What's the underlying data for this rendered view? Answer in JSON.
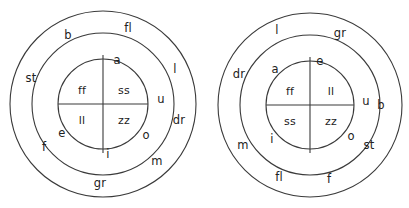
{
  "figure": {
    "type": "concentric-ring-diagram-pair",
    "background_color": "#ffffff",
    "stroke_color": "#3a3a3a",
    "text_color": "#222222"
  },
  "diagrams": [
    {
      "id": "left-diagram",
      "name": "left-syllable-ring-diagram",
      "center": {
        "x": 103,
        "y": 104
      },
      "circles": [
        {
          "name": "outer-ring-circle",
          "radius": 93
        },
        {
          "name": "middle-ring-circle",
          "radius": 71
        },
        {
          "name": "inner-core-circle",
          "radius": 45
        }
      ],
      "dividers": [
        {
          "name": "vertical-divider",
          "x1": 103,
          "y1": 55,
          "x2": 103,
          "y2": 153
        },
        {
          "name": "horizontal-divider",
          "x1": 58,
          "y1": 104,
          "x2": 148,
          "y2": 104
        }
      ],
      "inner_quadrants": [
        {
          "position": "top-left",
          "label": "ff",
          "x": 82,
          "y": 90
        },
        {
          "position": "top-right",
          "label": "ss",
          "x": 124,
          "y": 90
        },
        {
          "position": "bottom-left",
          "label": "ll",
          "x": 82,
          "y": 120
        },
        {
          "position": "bottom-right",
          "label": "zz",
          "x": 124,
          "y": 120
        }
      ],
      "middle_ring_labels": [
        {
          "label": "a",
          "x": 117,
          "y": 61
        },
        {
          "label": "u",
          "x": 161,
          "y": 100
        },
        {
          "label": "o",
          "x": 146,
          "y": 136
        },
        {
          "label": "i",
          "x": 108,
          "y": 155
        },
        {
          "label": "e",
          "x": 62,
          "y": 134
        }
      ],
      "outer_ring_labels": [
        {
          "label": "fl",
          "x": 128,
          "y": 29
        },
        {
          "label": "b",
          "x": 68,
          "y": 36
        },
        {
          "label": "st",
          "x": 31,
          "y": 79
        },
        {
          "label": "l",
          "x": 175,
          "y": 70
        },
        {
          "label": "dr",
          "x": 179,
          "y": 121
        },
        {
          "label": "m",
          "x": 157,
          "y": 162
        },
        {
          "label": "gr",
          "x": 100,
          "y": 184
        },
        {
          "label": "f",
          "x": 44,
          "y": 148
        }
      ]
    },
    {
      "id": "right-diagram",
      "name": "right-syllable-ring-diagram",
      "center": {
        "x": 310,
        "y": 105
      },
      "circles": [
        {
          "name": "outer-ring-circle",
          "radius": 92
        },
        {
          "name": "middle-ring-circle",
          "radius": 70
        },
        {
          "name": "inner-core-circle",
          "radius": 44
        }
      ],
      "dividers": [
        {
          "name": "vertical-divider",
          "x1": 310,
          "y1": 57,
          "x2": 310,
          "y2": 153
        },
        {
          "name": "horizontal-divider",
          "x1": 266,
          "y1": 105,
          "x2": 354,
          "y2": 105
        }
      ],
      "inner_quadrants": [
        {
          "position": "top-left",
          "label": "ff",
          "x": 290,
          "y": 91
        },
        {
          "position": "top-right",
          "label": "ll",
          "x": 331,
          "y": 91
        },
        {
          "position": "bottom-left",
          "label": "ss",
          "x": 290,
          "y": 121
        },
        {
          "position": "bottom-right",
          "label": "zz",
          "x": 331,
          "y": 121
        }
      ],
      "middle_ring_labels": [
        {
          "label": "e",
          "x": 320,
          "y": 62
        },
        {
          "label": "a",
          "x": 275,
          "y": 70
        },
        {
          "label": "u",
          "x": 366,
          "y": 102
        },
        {
          "label": "o",
          "x": 351,
          "y": 137
        },
        {
          "label": "i",
          "x": 272,
          "y": 140
        }
      ],
      "outer_ring_labels": [
        {
          "label": "l",
          "x": 277,
          "y": 31
        },
        {
          "label": "gr",
          "x": 340,
          "y": 34
        },
        {
          "label": "dr",
          "x": 239,
          "y": 75
        },
        {
          "label": "b",
          "x": 381,
          "y": 106
        },
        {
          "label": "st",
          "x": 369,
          "y": 146
        },
        {
          "label": "f",
          "x": 329,
          "y": 180
        },
        {
          "label": "fl",
          "x": 279,
          "y": 178
        },
        {
          "label": "m",
          "x": 243,
          "y": 146
        }
      ]
    }
  ]
}
